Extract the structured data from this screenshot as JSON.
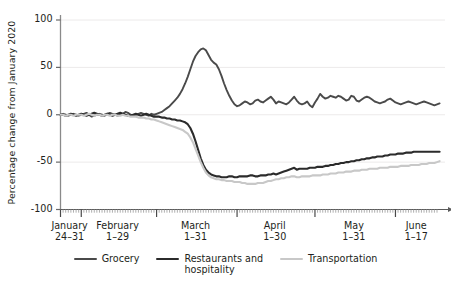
{
  "chart_data": {
    "type": "line",
    "title": "",
    "subtitle": "",
    "xlabel": "",
    "ylabel": "Percentage change from January 2020",
    "ylim": [
      -100,
      100
    ],
    "yticks": [
      100,
      50,
      0,
      -50,
      -100
    ],
    "ytick_labels": [
      "100",
      "50",
      "0",
      "-50",
      "-100"
    ],
    "grid": true,
    "grid_axis": "y",
    "legend_position": "bottom",
    "x_axis_groups": [
      {
        "month": "January",
        "days": "24–31",
        "n_days": 8
      },
      {
        "month": "February",
        "days": "1–29",
        "n_days": 29
      },
      {
        "month": "March",
        "days": "1–31",
        "n_days": 31
      },
      {
        "month": "April",
        "days": "1–30",
        "n_days": 30
      },
      {
        "month": "May",
        "days": "1–31",
        "n_days": 31
      },
      {
        "month": "June",
        "days": "1–17",
        "n_days": 17
      }
    ],
    "x_range_label": "January 24 – June 17, 2020",
    "n_points": 146,
    "series": [
      {
        "name": "Grocery",
        "color": "#4a4a4a",
        "width": 1.9,
        "values": [
          0,
          1,
          0,
          -1,
          0,
          1,
          0,
          -1,
          0,
          1,
          2,
          0,
          -2,
          -1,
          0,
          1,
          0,
          -1,
          1,
          2,
          1,
          0,
          -1,
          0,
          1,
          3,
          2,
          0,
          -1,
          0,
          1,
          2,
          1,
          0,
          -1,
          1,
          0,
          1,
          2,
          3,
          5,
          7,
          9,
          12,
          15,
          18,
          22,
          27,
          33,
          40,
          48,
          56,
          62,
          66,
          69,
          70,
          68,
          63,
          58,
          55,
          53,
          48,
          41,
          33,
          26,
          20,
          15,
          11,
          9,
          10,
          12,
          14,
          13,
          11,
          12,
          15,
          16,
          14,
          13,
          15,
          17,
          19,
          16,
          12,
          14,
          13,
          12,
          11,
          13,
          16,
          19,
          15,
          12,
          11,
          12,
          14,
          10,
          8,
          13,
          17,
          22,
          19,
          17,
          18,
          20,
          19,
          18,
          20,
          19,
          17,
          15,
          16,
          20,
          19,
          15,
          14,
          16,
          18,
          19,
          18,
          16,
          14,
          13,
          12,
          13,
          14,
          16,
          17,
          15,
          13,
          12,
          11,
          12,
          13,
          14,
          13,
          12,
          11,
          12,
          13,
          14,
          13,
          12,
          11,
          10,
          11,
          12
        ]
      },
      {
        "name": "Restaurants and hospitality",
        "color": "#2b2b2b",
        "width": 2.1,
        "values": [
          0,
          0,
          -1,
          0,
          1,
          0,
          -1,
          0,
          1,
          0,
          -1,
          0,
          1,
          2,
          1,
          0,
          -1,
          0,
          1,
          0,
          -1,
          0,
          1,
          2,
          1,
          0,
          -1,
          -1,
          0,
          1,
          0,
          -1,
          0,
          1,
          0,
          -1,
          -2,
          -2,
          -2,
          -3,
          -3,
          -4,
          -4,
          -5,
          -5,
          -6,
          -6,
          -7,
          -8,
          -10,
          -14,
          -20,
          -28,
          -37,
          -46,
          -53,
          -58,
          -61,
          -63,
          -64,
          -65,
          -65,
          -66,
          -66,
          -66,
          -65,
          -65,
          -66,
          -66,
          -65,
          -65,
          -65,
          -65,
          -64,
          -64,
          -65,
          -65,
          -64,
          -64,
          -64,
          -63,
          -63,
          -62,
          -63,
          -62,
          -61,
          -60,
          -59,
          -58,
          -57,
          -56,
          -58,
          -57,
          -57,
          -57,
          -57,
          -56,
          -56,
          -56,
          -55,
          -55,
          -55,
          -54,
          -54,
          -53,
          -53,
          -52,
          -52,
          -51,
          -51,
          -50,
          -50,
          -49,
          -49,
          -48,
          -48,
          -47,
          -47,
          -46,
          -46,
          -45,
          -45,
          -44,
          -44,
          -44,
          -43,
          -43,
          -42,
          -42,
          -42,
          -41,
          -41,
          -41,
          -40,
          -40,
          -40,
          -39,
          -39,
          -39,
          -39,
          -39,
          -39,
          -39,
          -39,
          -39,
          -39,
          -39
        ]
      },
      {
        "name": "Transportation",
        "color": "#c8c8c8",
        "width": 2.1,
        "values": [
          0,
          0,
          -1,
          0,
          0,
          -1,
          0,
          0,
          0,
          -1,
          0,
          1,
          0,
          -1,
          0,
          0,
          -1,
          0,
          0,
          -1,
          0,
          0,
          -1,
          -1,
          0,
          -1,
          -1,
          -2,
          -2,
          -2,
          -3,
          -3,
          -3,
          -4,
          -4,
          -5,
          -5,
          -6,
          -7,
          -8,
          -9,
          -10,
          -11,
          -12,
          -13,
          -14,
          -15,
          -16,
          -18,
          -20,
          -24,
          -29,
          -36,
          -43,
          -50,
          -56,
          -61,
          -64,
          -66,
          -67,
          -68,
          -68,
          -69,
          -69,
          -70,
          -70,
          -70,
          -71,
          -71,
          -71,
          -72,
          -72,
          -73,
          -73,
          -73,
          -73,
          -72,
          -72,
          -72,
          -71,
          -70,
          -70,
          -69,
          -68,
          -68,
          -67,
          -67,
          -66,
          -66,
          -65,
          -65,
          -66,
          -66,
          -65,
          -65,
          -65,
          -65,
          -64,
          -64,
          -64,
          -64,
          -63,
          -63,
          -63,
          -62,
          -62,
          -62,
          -61,
          -61,
          -61,
          -60,
          -60,
          -60,
          -59,
          -59,
          -59,
          -58,
          -58,
          -58,
          -57,
          -57,
          -57,
          -57,
          -56,
          -56,
          -56,
          -56,
          -55,
          -55,
          -55,
          -55,
          -54,
          -54,
          -54,
          -54,
          -53,
          -53,
          -53,
          -53,
          -52,
          -52,
          -52,
          -51,
          -51,
          -51,
          -50,
          -49
        ]
      }
    ]
  },
  "legend": {
    "items": [
      {
        "label": "Grocery",
        "color": "#4a4a4a"
      },
      {
        "label": "Restaurants and\nhospitality",
        "color": "#2b2b2b"
      },
      {
        "label": "Transportation",
        "color": "#c8c8c8"
      }
    ]
  },
  "axis": {
    "y_title": "Percentage change from January 2020"
  }
}
